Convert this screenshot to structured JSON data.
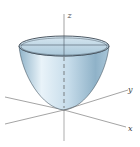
{
  "figure": {
    "axes": {
      "z_label": "z",
      "y_label": "y",
      "x_label": "x"
    },
    "colors": {
      "surface_light": "#e8f2f8",
      "surface_mid": "#b9d4e4",
      "surface_dark": "#7fa6bf",
      "rim": "#4a5a66",
      "axis": "#555555"
    }
  }
}
